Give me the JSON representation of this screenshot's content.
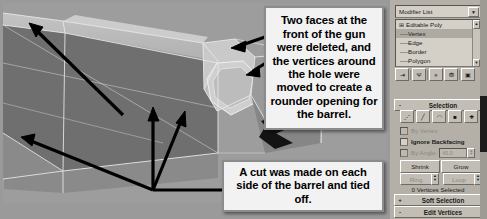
{
  "viewport": {
    "label": "perspective-viewport",
    "background_color": "#9d9d9d",
    "mesh_description": "shaded low-poly gun barrel with white wireframe edges and a rounded hole at the muzzle"
  },
  "callouts": [
    {
      "id": "callout-barrel-opening",
      "text": "Two faces at the front of the gun were deleted, and the vertices around the hole were moved to create a rounder opening for the barrel.",
      "arrow_count": 3
    },
    {
      "id": "callout-cut-tied-off",
      "text": "A cut was made on each side of the barrel and tied off.",
      "arrow_count": 3
    }
  ],
  "panel": {
    "modifier_list": {
      "label": "Modifier List",
      "dropdown_icon": "chevron-down-icon"
    },
    "stack": [
      {
        "label": "Editable Poly",
        "level": "root",
        "selected": false,
        "toggle_icon": "box-plus-icon"
      },
      {
        "label": "Vertex",
        "level": "child",
        "selected": true
      },
      {
        "label": "Edge",
        "level": "child",
        "selected": false
      },
      {
        "label": "Border",
        "level": "child",
        "selected": false
      },
      {
        "label": "Polygon",
        "level": "child",
        "selected": false
      },
      {
        "label": "Element",
        "level": "child",
        "selected": false
      }
    ],
    "stack_tools": [
      {
        "name": "pin-stack-icon",
        "glyph": "⇥"
      },
      {
        "name": "show-end-result-icon",
        "glyph": "Ψ"
      },
      {
        "name": "make-unique-icon",
        "glyph": "⋄"
      },
      {
        "name": "remove-modifier-icon",
        "glyph": "⛃"
      },
      {
        "name": "configure-modifier-sets-icon",
        "glyph": "▣"
      }
    ],
    "rollouts": {
      "selection": {
        "label": "Selection",
        "sign": "-",
        "expanded": true
      },
      "soft_selection": {
        "label": "Soft Selection",
        "sign": "+",
        "expanded": false
      },
      "edit_vertices": {
        "label": "Edit Vertices",
        "sign": "-",
        "expanded": true
      }
    },
    "sub_object_buttons": [
      {
        "name": "vertex-level-icon",
        "glyph": "⋰"
      },
      {
        "name": "edge-level-icon",
        "glyph": "╱"
      },
      {
        "name": "border-level-icon",
        "glyph": "◠"
      },
      {
        "name": "polygon-level-icon",
        "glyph": "■"
      },
      {
        "name": "element-level-icon",
        "glyph": "❖"
      }
    ],
    "options": [
      {
        "label": "By Vertex",
        "checked": false,
        "enabled": false
      },
      {
        "label": "Ignore Backfacing",
        "checked": false,
        "enabled": true
      },
      {
        "label": "By Angle:",
        "checked": false,
        "enabled": false,
        "value": "45.0"
      }
    ],
    "buttons": {
      "shrink": {
        "label": "Shrink",
        "enabled": true
      },
      "grow": {
        "label": "Grow",
        "enabled": true
      },
      "ring": {
        "label": "Ring",
        "enabled": false
      },
      "loop": {
        "label": "Loop",
        "enabled": false
      }
    },
    "selection_status": "0 Vertices Selected"
  }
}
